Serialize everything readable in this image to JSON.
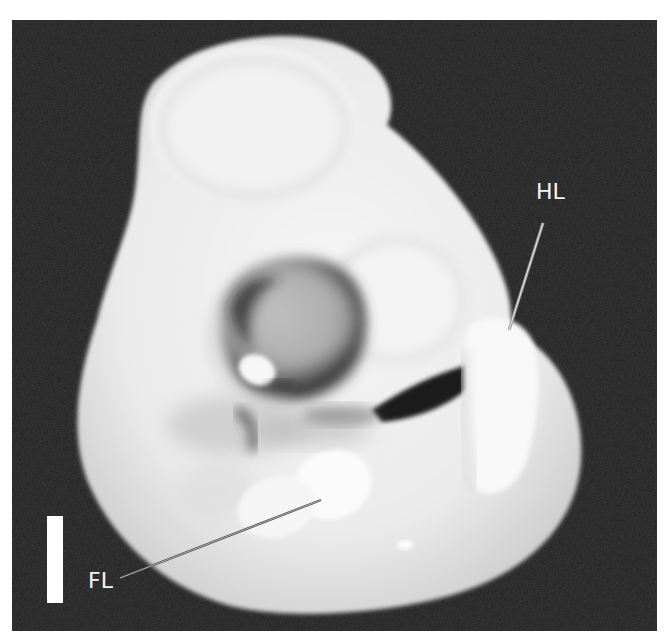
{
  "figure": {
    "type": "photograph",
    "background_color": "#1e1e1e",
    "labels": [
      {
        "id": "hl",
        "text": "HL"
      },
      {
        "id": "fl",
        "text": "FL"
      }
    ],
    "scale_bar": {
      "visible": true,
      "label": ""
    }
  }
}
